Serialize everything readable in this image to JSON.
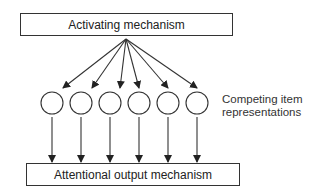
{
  "diagram": {
    "top_box": {
      "label": "Activating mechanism"
    },
    "bottom_box": {
      "label": "Attentional output mechanism"
    },
    "side_label": {
      "line1": "Competing item",
      "line2": "representations"
    },
    "nodes": [
      {
        "id": "item-1"
      },
      {
        "id": "item-2"
      },
      {
        "id": "item-3"
      },
      {
        "id": "item-4"
      },
      {
        "id": "item-5"
      },
      {
        "id": "item-6"
      }
    ],
    "edges": [
      {
        "from": "activating-mechanism",
        "to": "item-1"
      },
      {
        "from": "activating-mechanism",
        "to": "item-2"
      },
      {
        "from": "activating-mechanism",
        "to": "item-3"
      },
      {
        "from": "activating-mechanism",
        "to": "item-4"
      },
      {
        "from": "activating-mechanism",
        "to": "item-5"
      },
      {
        "from": "activating-mechanism",
        "to": "item-6"
      },
      {
        "from": "item-1",
        "to": "attentional-output-mechanism"
      },
      {
        "from": "item-2",
        "to": "attentional-output-mechanism"
      },
      {
        "from": "item-3",
        "to": "attentional-output-mechanism"
      },
      {
        "from": "item-4",
        "to": "attentional-output-mechanism"
      },
      {
        "from": "item-5",
        "to": "attentional-output-mechanism"
      },
      {
        "from": "item-6",
        "to": "attentional-output-mechanism"
      }
    ],
    "colors": {
      "stroke": "#333333",
      "background": "#ffffff"
    }
  }
}
